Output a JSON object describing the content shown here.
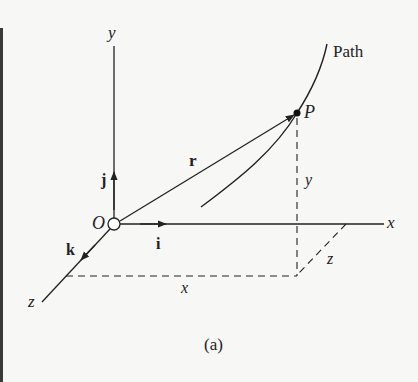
{
  "figure": {
    "caption": "(a)",
    "axes": {
      "x_label": "x",
      "y_label": "y",
      "z_label": "z",
      "origin_label": "O"
    },
    "unit_vectors": {
      "i": "i",
      "j": "j",
      "k": "k"
    },
    "position_vector_label": "r",
    "point_label": "P",
    "path_label": "Path",
    "components": {
      "x": "x",
      "y": "y",
      "z": "z"
    },
    "colors": {
      "ink": "#222222",
      "background": "#f7f7f6"
    }
  }
}
